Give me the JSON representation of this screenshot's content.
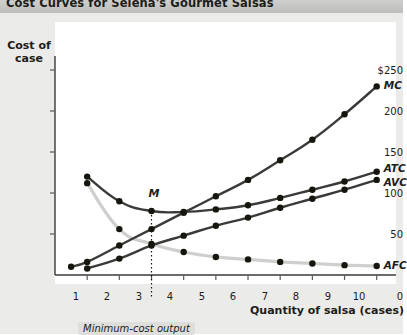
{
  "title": "Cost Curves for Selena's Gourmet Salsas",
  "annotations": {
    "m_label": "M",
    "min_cost_output": "Minimum-cost output"
  },
  "colors": {
    "dark_curve": "#3a3a38",
    "light_curve": "#cfcfcd",
    "panel": "#ebebe9",
    "titlebar": "#c6c6c4",
    "text": "#1d1d1b"
  },
  "chart_data": {
    "type": "line",
    "title": "Cost Curves for Selena's Gourmet Salsas",
    "xlabel": "Quantity of salsa (cases)",
    "ylabel": "Cost of case",
    "xlim": [
      0,
      10.6
    ],
    "ylim": [
      0,
      275
    ],
    "grid": false,
    "legend": "inline-right",
    "xticks": [
      0,
      1,
      2,
      3,
      4,
      5,
      6,
      7,
      8,
      9,
      10
    ],
    "yticks": [
      0,
      50,
      100,
      150,
      200,
      250
    ],
    "ytick_labels": [
      "0",
      "50",
      "100",
      "150",
      "200",
      "$250"
    ],
    "minimum_cost_output": 3,
    "series": [
      {
        "name": "MC",
        "label": "MC",
        "color": "#3a3a38",
        "x": [
          0.5,
          1,
          2,
          3,
          4,
          5,
          6,
          7,
          8,
          9,
          10
        ],
        "y": [
          10,
          16,
          36,
          56,
          76,
          96,
          116,
          140,
          165,
          196,
          230
        ]
      },
      {
        "name": "ATC",
        "label": "ATC",
        "color": "#3a3a38",
        "x": [
          1,
          2,
          3,
          4,
          5,
          6,
          7,
          8,
          9,
          10
        ],
        "y": [
          120,
          90,
          78,
          77,
          80,
          85,
          94,
          104,
          114,
          126
        ]
      },
      {
        "name": "AVC",
        "label": "AVC",
        "color": "#3a3a38",
        "x": [
          1,
          2,
          3,
          4,
          5,
          6,
          7,
          8,
          9,
          10
        ],
        "y": [
          8,
          20,
          36,
          48,
          60,
          70,
          82,
          93,
          104,
          116
        ]
      },
      {
        "name": "AFC",
        "label": "AFC",
        "color": "#cfcfcd",
        "x": [
          1,
          2,
          3,
          4,
          5,
          6,
          7,
          8,
          9,
          10
        ],
        "y": [
          112,
          56,
          38,
          28,
          22,
          19,
          16,
          14,
          12,
          11
        ]
      }
    ]
  }
}
